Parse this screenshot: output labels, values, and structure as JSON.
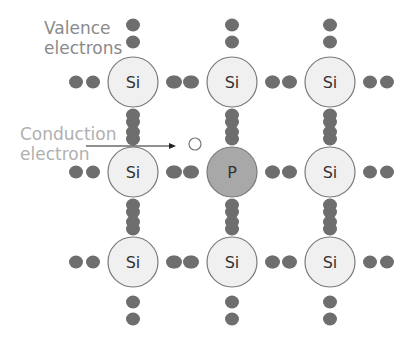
{
  "labels": {
    "valence": [
      "Valence",
      "electrons"
    ],
    "conduction": [
      "Conduction",
      "electron"
    ]
  },
  "atoms": [
    {
      "symbol": "Si",
      "x": 133,
      "y": 82,
      "type": "si"
    },
    {
      "symbol": "Si",
      "x": 232,
      "y": 82,
      "type": "si"
    },
    {
      "symbol": "Si",
      "x": 330,
      "y": 82,
      "type": "si"
    },
    {
      "symbol": "Si",
      "x": 133,
      "y": 172,
      "type": "si"
    },
    {
      "symbol": "P",
      "x": 232,
      "y": 172,
      "type": "p"
    },
    {
      "symbol": "Si",
      "x": 330,
      "y": 172,
      "type": "si"
    },
    {
      "symbol": "Si",
      "x": 133,
      "y": 262,
      "type": "si"
    },
    {
      "symbol": "Si",
      "x": 232,
      "y": 262,
      "type": "si"
    },
    {
      "symbol": "Si",
      "x": 330,
      "y": 262,
      "type": "si"
    }
  ],
  "colors": {
    "si_fill": "#f0f0f0",
    "p_fill": "#a8a8a8",
    "electron": "#6e6e6e",
    "outline": "#7a7a7a"
  }
}
